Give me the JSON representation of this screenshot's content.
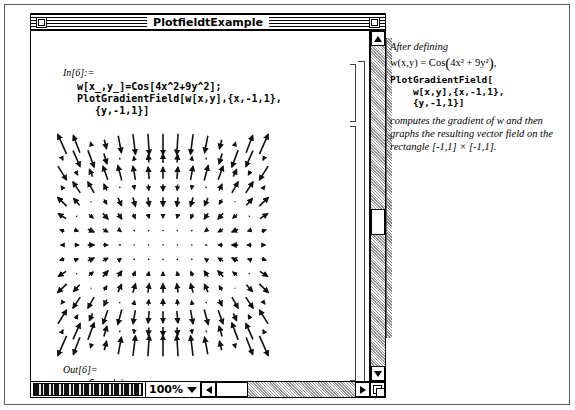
{
  "window": {
    "title": "PlotfieldtExample",
    "close_box_name": "close-box",
    "zoom_box_name": "zoom-box"
  },
  "notebook": {
    "input_label": "In[6]:=",
    "input_code": "w[x_,y_]=Cos[4x^2+9y^2];\nPlotGradientField[w[x,y],{x,-1,1},\n   {y,-1,1}]",
    "output_label": "Out[6]=",
    "output_code": "-Graphics-"
  },
  "bottom_bar": {
    "zoom_value": "100%",
    "caret_icon": "chevron-down-icon",
    "left_arrow_icon": "scroll-left-arrow-icon",
    "right_arrow_icon": "scroll-right-arrow-icon",
    "grow_icon": "resize-grow-icon"
  },
  "vscroll": {
    "up_arrow_icon": "scroll-up-arrow-icon",
    "down_arrow_icon": "scroll-down-arrow-icon"
  },
  "side_panel": {
    "intro": "After defining",
    "formula_lhs": "w(x,y) = Cos",
    "formula_inner": "4x² + 9y²",
    "formula_tail": ",",
    "code": "PlotGradientField[\n    w[x,y],{x,-1,1},\n    {y,-1,1}]",
    "explanation": "computes the gradient of w and then graphs the resulting vector field on the rectangle [-1,1] × [-1,1]."
  },
  "chart_data": {
    "type": "scatter",
    "xlabel": "x",
    "ylabel": "y",
    "xlim": [
      -1,
      1
    ],
    "ylim": [
      -1,
      1
    ],
    "grid": false,
    "legend": "none",
    "field_function": "grad w = (-8x*Sin(4x^2+9y^2), -18y*Sin(4x^2+9y^2))",
    "grid_nx": 15,
    "grid_ny": 15,
    "arrow_scale": 0.085,
    "note": "Arrows drawn at a 15x15 lattice over [-1,1]x[-1,1]; length proportional to |grad w|, capped by Mathematica's default scaling."
  }
}
